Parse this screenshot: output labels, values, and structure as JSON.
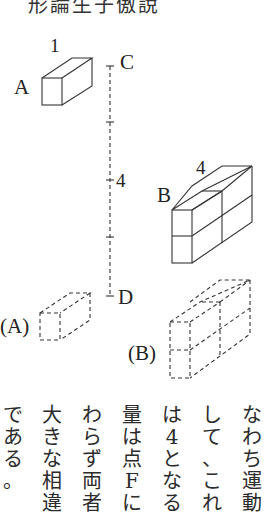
{
  "top_caption": "形論生子傲說",
  "figure": {
    "labels": {
      "box_a": "A",
      "box_a_length": "1",
      "box_b": "B",
      "box_b_length": "4",
      "axis_top": "C",
      "axis_bottom": "D",
      "axis_value": "4",
      "ghost_a": "(A)",
      "ghost_b": "(B)"
    }
  },
  "body_text": {
    "direction": "vertical-rl",
    "columns": [
      "なわち運動",
      "して、これ",
      "は4となる",
      "量は点Fに",
      "わらず両者",
      "大きな相違",
      "である。"
    ]
  }
}
